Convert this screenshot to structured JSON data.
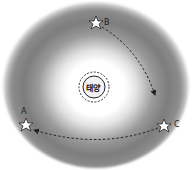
{
  "diagram": {
    "center": {
      "label": "태양",
      "icon": "sun-icon"
    },
    "zone": {
      "description": "gray ring around sun",
      "color": "#888888"
    },
    "stars": [
      {
        "id": "A",
        "label": "A",
        "x": 26,
        "y": 125
      },
      {
        "id": "B",
        "label": "B",
        "x": 96,
        "y": 23
      },
      {
        "id": "C",
        "label": "C",
        "x": 164,
        "y": 126
      }
    ],
    "paths": [
      {
        "from": "B",
        "to": "C",
        "style": "dashed-arrow"
      },
      {
        "from": "C",
        "to": "A",
        "style": "dashed-arrow"
      }
    ]
  }
}
